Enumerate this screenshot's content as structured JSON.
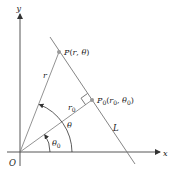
{
  "diagram": {
    "type": "polar-coordinates-line",
    "axes": {
      "x_label": "x",
      "y_label": "y",
      "origin_label": "O"
    },
    "points": {
      "P": {
        "label": "P",
        "coords_text": "(r, θ)"
      },
      "P0": {
        "label": "P",
        "subscript": "0",
        "coords_text": "(r₀, θ₀)"
      }
    },
    "segments": {
      "r_label": "r",
      "r0_label": "r",
      "r0_sub": "0"
    },
    "angles": {
      "theta_label": "θ",
      "theta0_label": "θ",
      "theta0_sub": "0"
    },
    "line_label": "L",
    "colors": {
      "axis": "#333333",
      "line": "#777777",
      "point": "#999999",
      "text": "#1a1a1a"
    }
  }
}
